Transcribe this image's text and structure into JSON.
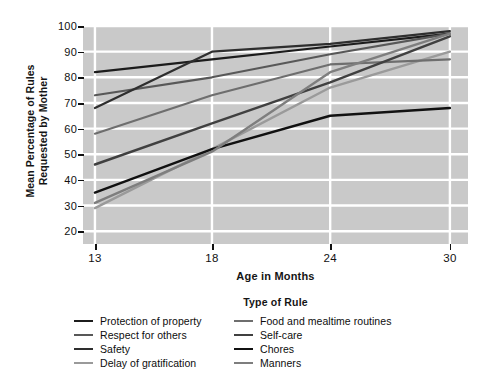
{
  "chart_data": {
    "type": "line",
    "title": "",
    "xlabel": "Age in Months",
    "ylabel": "Mean Percentage of Rules Requested by Mother",
    "legend_title": "Type of Rule",
    "legend_position": "bottom",
    "grid": true,
    "plot_background": "#c9c9c9",
    "gridline_color": "#ffffff",
    "x": [
      13,
      18,
      24,
      30
    ],
    "xticklabels": [
      "13",
      "18",
      "24",
      "30"
    ],
    "xtick_positions_pct": [
      3.1,
      33.5,
      64.2,
      95.3
    ],
    "ylim": [
      15,
      100
    ],
    "yticks": [
      20,
      30,
      40,
      50,
      60,
      70,
      80,
      90,
      100
    ],
    "yticklabels": [
      "20",
      "30",
      "40",
      "50",
      "60",
      "70",
      "80",
      "90",
      "100"
    ],
    "series": [
      {
        "name": "Protection of property",
        "color": "#1c1c1c",
        "width": 2.2,
        "values": [
          82,
          87,
          92,
          97
        ]
      },
      {
        "name": "Respect for others",
        "color": "#585858",
        "width": 2.2,
        "values": [
          73,
          80,
          89,
          97
        ]
      },
      {
        "name": "Safety",
        "color": "#2e2e2e",
        "width": 2.2,
        "values": [
          68,
          90,
          93,
          98
        ]
      },
      {
        "name": "Delay of gratification",
        "color": "#9a9a9a",
        "width": 2.4,
        "values": [
          29,
          52,
          76,
          90
        ]
      },
      {
        "name": "Food and mealtime routines",
        "color": "#6e6e6e",
        "width": 2.2,
        "values": [
          58,
          73,
          85,
          87
        ]
      },
      {
        "name": "Self-care",
        "color": "#404040",
        "width": 2.4,
        "values": [
          46,
          62,
          78,
          96
        ]
      },
      {
        "name": "Chores",
        "color": "#111111",
        "width": 2.4,
        "values": [
          35,
          52,
          65,
          68
        ]
      },
      {
        "name": "Manners",
        "color": "#7e7e7e",
        "width": 2.4,
        "values": [
          31,
          51,
          82,
          97
        ]
      }
    ]
  },
  "legend": {
    "title": "Type of Rule",
    "columns": [
      [
        "Protection of property",
        "Respect for others",
        "Safety",
        "Delay of gratification"
      ],
      [
        "Food and mealtime routines",
        "Self-care",
        "Chores",
        "Manners"
      ]
    ]
  }
}
